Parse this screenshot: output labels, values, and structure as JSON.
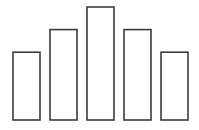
{
  "chart_data": {
    "type": "bar",
    "title": "",
    "xlabel": "",
    "ylabel": "",
    "categories": [
      "1",
      "2",
      "3",
      "4",
      "5"
    ],
    "values": [
      3,
      4,
      5,
      4,
      3
    ],
    "ylim": [
      0,
      5
    ],
    "grid": false,
    "legend": "none",
    "show_axes": false,
    "bar_fill": "#ffffff",
    "bar_stroke": "#3c3c3c"
  }
}
